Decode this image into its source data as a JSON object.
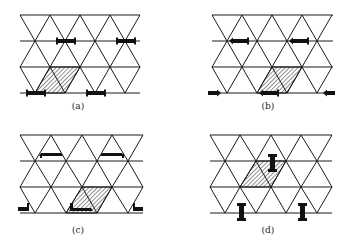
{
  "panels": [
    {
      "id": "a",
      "caption": "(a)",
      "ornament": "horizontal-bars"
    },
    {
      "id": "b",
      "caption": "(b)",
      "ornament": "arrow-bars"
    },
    {
      "id": "c",
      "caption": "(c)",
      "ornament": "angle-brackets"
    },
    {
      "id": "d",
      "caption": "(d)",
      "ornament": "vertical-I-beams"
    }
  ],
  "colors": {
    "line": "#1a1a1a",
    "fill": "#111111",
    "background": "#ffffff"
  }
}
